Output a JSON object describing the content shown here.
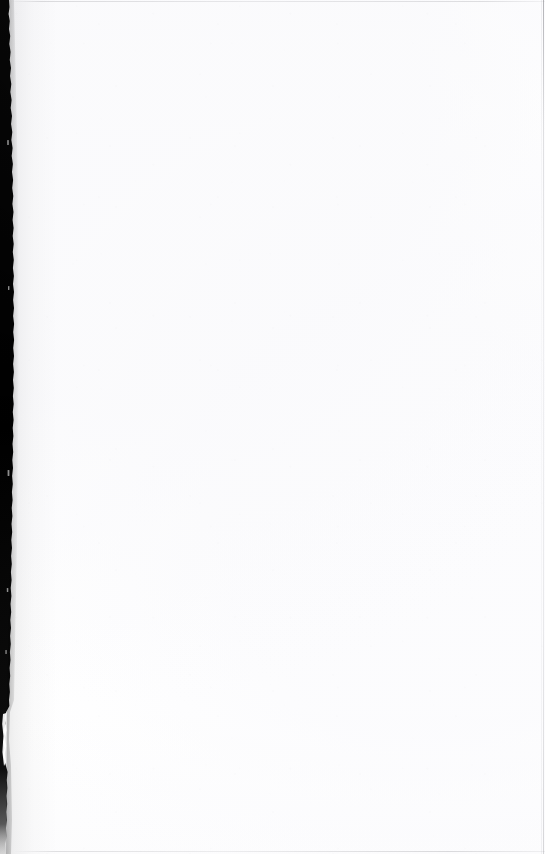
{
  "page": {
    "kind": "scanned-page",
    "state": "blank",
    "body_text": "",
    "width_px": 545,
    "height_px": 854,
    "background_color": "#ffffff",
    "paper_tint_color": "#fdfdfe"
  },
  "artifacts": {
    "gutter": {
      "name": "binding-gutter-shadow",
      "edge": "left",
      "color": "#000000",
      "min_width_px": 3,
      "max_width_px": 14,
      "notch_top_px": 710,
      "notch_bottom_px": 766
    },
    "edges": {
      "top_rule_color": "#96969b",
      "bottom_rule_color": "#9b9ba0",
      "right_rule_color": "#78787e"
    }
  }
}
